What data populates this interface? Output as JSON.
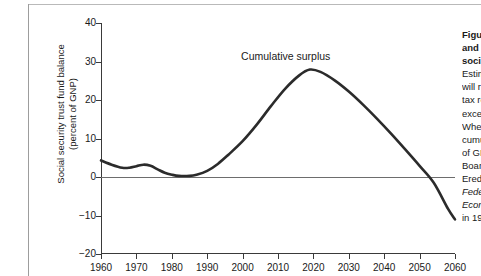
{
  "figure": {
    "y_axis_title": "Social security trust fund balance\n(percent of GNP)",
    "annotation": "Cumulative surplus"
  },
  "caption": {
    "lines": [
      {
        "text": "Figure 1",
        "style": "bold"
      },
      {
        "text": "and the",
        "style": "bold"
      },
      {
        "text": "social",
        "style": "bold"
      },
      {
        "text": "Estimated",
        "style": "normal"
      },
      {
        "text": "will rise",
        "style": "normal"
      },
      {
        "text": "tax reve",
        "style": "normal"
      },
      {
        "text": "exceed",
        "style": "normal"
      },
      {
        "text": "When th",
        "style": "normal"
      },
      {
        "text": "cumulat",
        "style": "normal"
      },
      {
        "text": "of GNP.",
        "style": "normal"
      },
      {
        "text": "Board o",
        "style": "normal"
      },
      {
        "text": "Ered by",
        "style": "normal"
      },
      {
        "text": "Federal",
        "style": "italic"
      },
      {
        "text": "Economi",
        "style": "italic"
      },
      {
        "text": "in 1989",
        "style": "normal"
      }
    ]
  },
  "chart_data": {
    "type": "line",
    "title": "",
    "xlabel": "",
    "ylabel": "Social security trust fund balance (percent of GNP)",
    "xlim": [
      1960,
      2060
    ],
    "ylim": [
      -20,
      40
    ],
    "xticks": [
      1960,
      1970,
      1980,
      1990,
      2000,
      2010,
      2020,
      2030,
      2040,
      2050,
      2060
    ],
    "yticks": [
      40,
      30,
      20,
      10,
      0,
      -10,
      -20
    ],
    "grid": false,
    "legend_position": "none",
    "zero_line": 0,
    "annotations": [
      {
        "text": "Cumulative surplus",
        "x": 2012,
        "y": 31.5
      }
    ],
    "series": [
      {
        "name": "Cumulative surplus",
        "color": "#2b2b2b",
        "x": [
          1960,
          1963,
          1966,
          1968,
          1970,
          1972,
          1974,
          1976,
          1978,
          1980,
          1982,
          1985,
          1987,
          1990,
          1993,
          1996,
          2000,
          2004,
          2008,
          2012,
          2016,
          2019,
          2022,
          2026,
          2030,
          2034,
          2038,
          2042,
          2046,
          2050,
          2054,
          2058,
          2060
        ],
        "y": [
          4.3,
          3.2,
          2.4,
          2.4,
          2.8,
          3.2,
          2.9,
          2.0,
          1.1,
          0.6,
          0.3,
          0.3,
          0.6,
          1.6,
          3.4,
          5.8,
          9.3,
          13.6,
          18.4,
          22.9,
          26.4,
          27.9,
          27.3,
          25.1,
          22.2,
          18.8,
          15.1,
          11.2,
          7.1,
          2.9,
          -1.5,
          -8.2,
          -11.0
        ]
      }
    ]
  }
}
